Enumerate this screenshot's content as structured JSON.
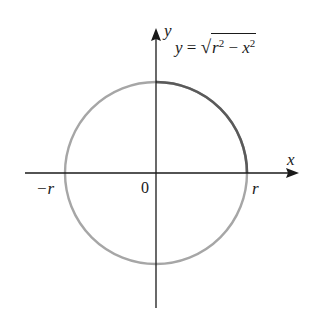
{
  "diagram": {
    "equation": {
      "lhs": "y",
      "eq": "=",
      "radical_sign": "√",
      "term1_base": "r",
      "term1_exp": "2",
      "minus": "−",
      "term2_base": "x",
      "term2_exp": "2"
    },
    "axes": {
      "x_label": "x",
      "y_label": "y"
    },
    "ticks": {
      "neg_r": "−r",
      "origin": "0",
      "pos_r": "r"
    },
    "colors": {
      "circle": "#a6a6a6",
      "highlight_arc": "#555555",
      "axes": "#1a1a1a",
      "background": "#ffffff"
    },
    "geometry": {
      "center": [
        156,
        173
      ],
      "radius": 91
    }
  }
}
